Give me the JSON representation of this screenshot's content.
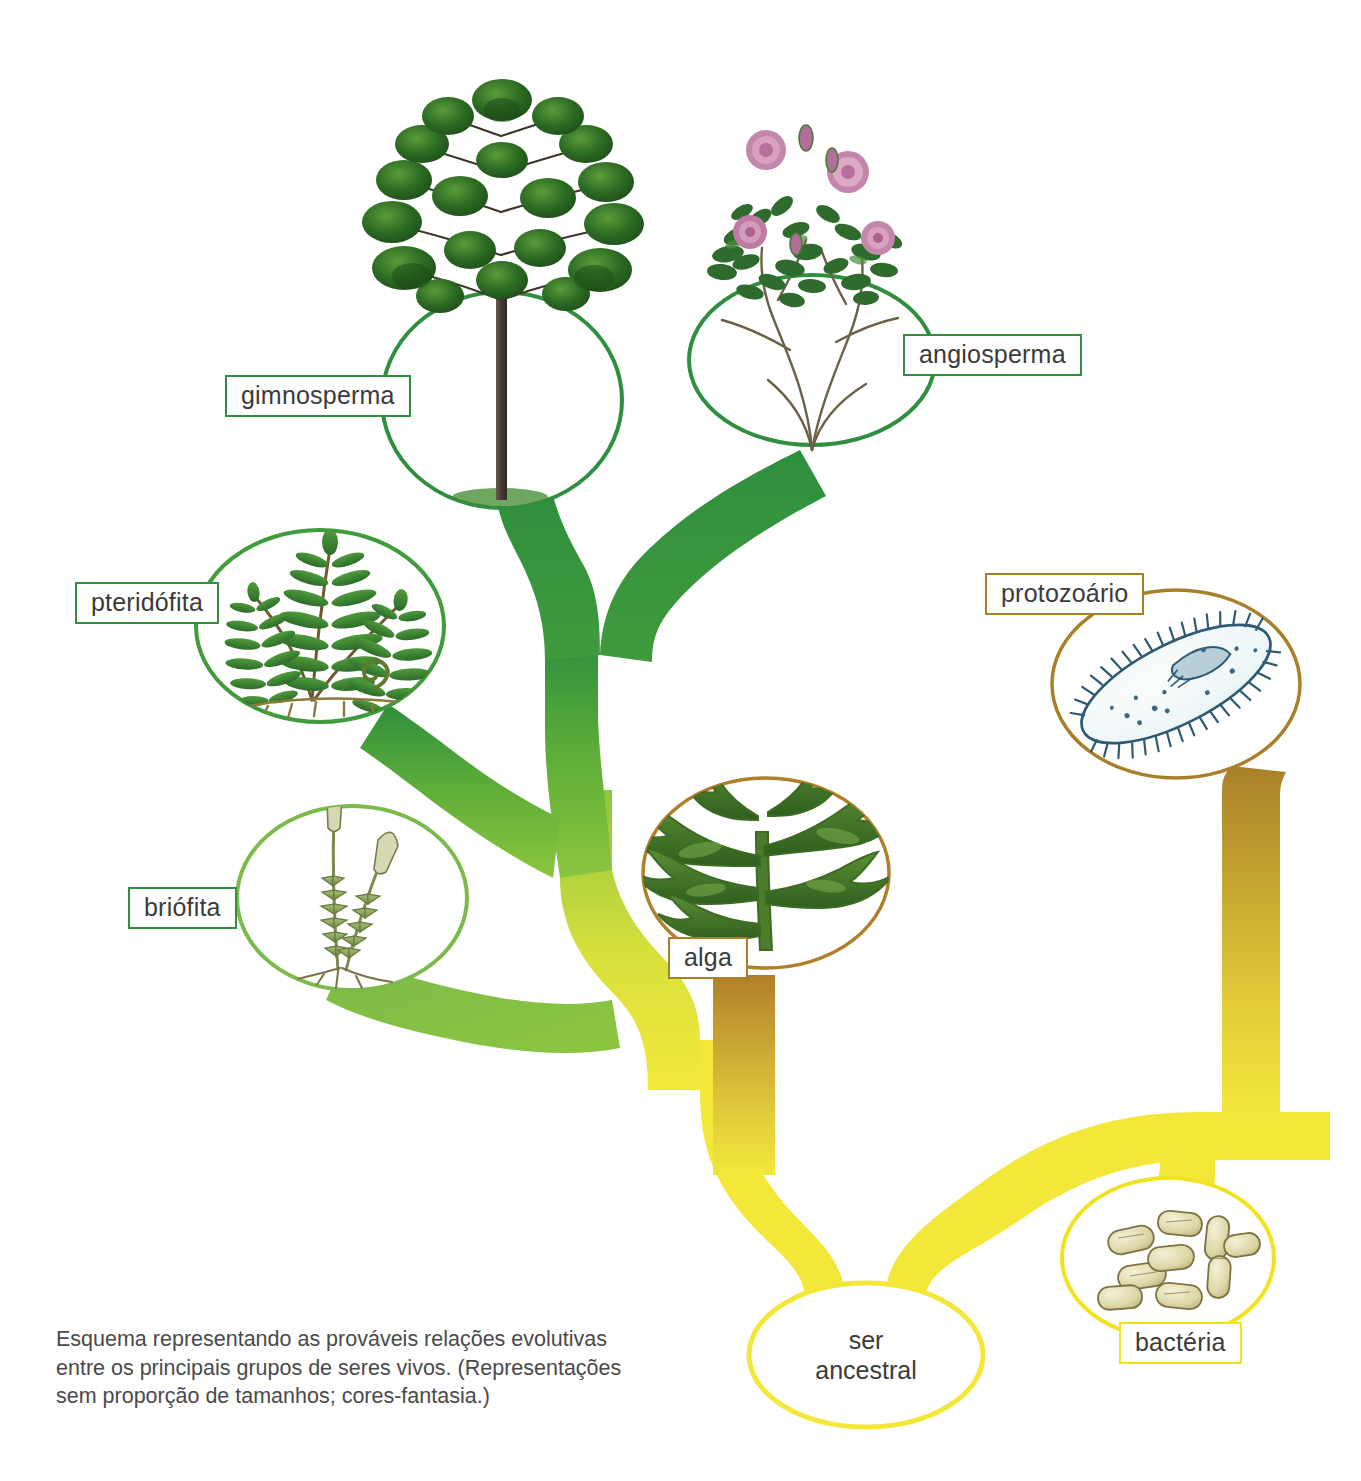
{
  "diagram": {
    "caption": "Esquema representando as prováveis relações evolutivas\nentre os principais grupos de seres vivos. (Representações\nsem proporção de tamanhos; cores-fantasia.)",
    "colors": {
      "green_dark": "#2f8f3e",
      "green_mid": "#53a832",
      "green_light": "#8cc63f",
      "yellow": "#f3e83a",
      "brown": "#b07f2a",
      "label_text": "#3b3b3b",
      "background": "#ffffff"
    }
  },
  "nodes": [
    {
      "id": "gimnosperma",
      "label": "gimnosperma",
      "border": "green",
      "illustration": "conifer-araucaria-tree",
      "bubble_color": "#2f8f3e"
    },
    {
      "id": "angiosperma",
      "label": "angiosperma",
      "border": "green",
      "illustration": "rose-bush-flowering-plant",
      "bubble_color": "#2f8f3e"
    },
    {
      "id": "pteridofita",
      "label": "pteridófita",
      "border": "green",
      "illustration": "fern-fronds",
      "bubble_color": "#3f9b3c"
    },
    {
      "id": "briofita",
      "label": "briófita",
      "border": "green",
      "illustration": "moss-sporophytes",
      "bubble_color": "#7cba4a"
    },
    {
      "id": "alga",
      "label": "alga",
      "border": "brown",
      "illustration": "seaweed-algae",
      "bubble_color": "#b07f2a"
    },
    {
      "id": "protozoario",
      "label": "protozoário",
      "border": "brown",
      "illustration": "paramecium-ciliate",
      "bubble_color": "#a9802a"
    },
    {
      "id": "bacteria",
      "label": "bactéria",
      "border": "yellow",
      "illustration": "bacilli-rod-bacteria",
      "bubble_color": "#f2e320"
    },
    {
      "id": "ser-ancestral",
      "label": "ser\nancestral",
      "border": "none",
      "illustration": "empty-ellipse",
      "bubble_color": "#f3e83a"
    }
  ],
  "edges": [
    {
      "from": "ser-ancestral",
      "to": "plant-stem-split",
      "color_start": "#f3e83a",
      "color_end": "#f3e83a"
    },
    {
      "from": "plant-stem-split",
      "to": "alga",
      "color_start": "#f3e83a",
      "color_end": "#b07f2a"
    },
    {
      "from": "plant-stem-split",
      "to": "green-trunk",
      "color_start": "#f3e83a",
      "color_end": "#8cc63f"
    },
    {
      "from": "green-trunk",
      "to": "briofita",
      "color_start": "#8cc63f",
      "color_end": "#8cc63f"
    },
    {
      "from": "green-trunk",
      "to": "pteridofita",
      "color_start": "#6fb840",
      "color_end": "#3f9b3c"
    },
    {
      "from": "green-trunk",
      "to": "seed-plant-split",
      "color_start": "#53a832",
      "color_end": "#2f8f3e"
    },
    {
      "from": "seed-plant-split",
      "to": "gimnosperma",
      "color_start": "#2f8f3e",
      "color_end": "#2f8f3e"
    },
    {
      "from": "seed-plant-split",
      "to": "angiosperma",
      "color_start": "#2f8f3e",
      "color_end": "#2f8f3e"
    },
    {
      "from": "ser-ancestral",
      "to": "protist-split",
      "color_start": "#f3e83a",
      "color_end": "#f3e83a"
    },
    {
      "from": "protist-split",
      "to": "bacteria",
      "color_start": "#f3e83a",
      "color_end": "#f3e83a"
    },
    {
      "from": "protist-split",
      "to": "protozoario",
      "color_start": "#f3e83a",
      "color_end": "#b07f2a"
    }
  ]
}
